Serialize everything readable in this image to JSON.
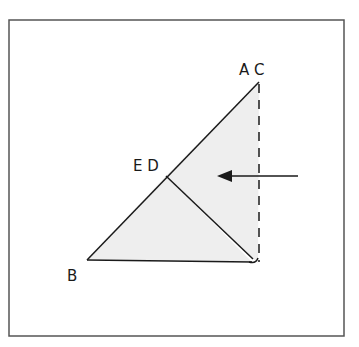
{
  "diagram": {
    "type": "geometry-fold",
    "frame": {
      "x1": 9,
      "y1": 20,
      "x2": 344,
      "y2": 336,
      "stroke": "#555555"
    },
    "fill_color": "#eeeeee",
    "line_color": "#1a1a1a",
    "points": {
      "AC": {
        "x": 259,
        "y": 82
      },
      "ED": {
        "x": 166,
        "y": 176
      },
      "B": {
        "x": 87,
        "y": 260
      },
      "corner": {
        "x": 258,
        "y": 263
      }
    },
    "labels": {
      "ac": "A C",
      "ed": "E D",
      "b": "B"
    },
    "arrow": {
      "from": {
        "x": 298,
        "y": 176
      },
      "to": {
        "x": 217,
        "y": 176
      },
      "direction": "left"
    },
    "dashed_edge": {
      "from": "AC",
      "to": "corner",
      "dash": "9 7"
    }
  }
}
